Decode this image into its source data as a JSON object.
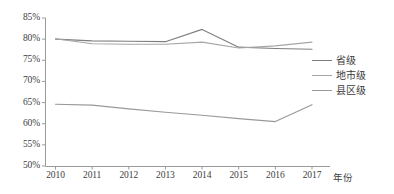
{
  "chart_data": {
    "type": "line",
    "title": "",
    "xlabel": "年份",
    "ylabel": "",
    "categories": [
      "2010",
      "2011",
      "2012",
      "2013",
      "2014",
      "2015",
      "2016",
      "2017"
    ],
    "x": [
      2010,
      2011,
      2012,
      2013,
      2014,
      2015,
      2016,
      2017
    ],
    "ylim": [
      50,
      85
    ],
    "yticks": [
      50,
      55,
      60,
      65,
      70,
      75,
      80,
      85
    ],
    "ytick_labels": [
      "50%",
      "55%",
      "60%",
      "65%",
      "70%",
      "75%",
      "80%",
      "85%"
    ],
    "grid": false,
    "legend_position": "right",
    "series": [
      {
        "name": "省级",
        "color": "#7f7f7f",
        "values": [
          80.0,
          79.6,
          79.5,
          79.4,
          82.3,
          78.1,
          77.8,
          77.6
        ]
      },
      {
        "name": "地市级",
        "color": "#a6a6a6",
        "values": [
          80.1,
          78.9,
          78.8,
          78.8,
          79.3,
          77.9,
          78.4,
          79.3
        ]
      },
      {
        "name": "县区级",
        "color": "#999999",
        "values": [
          64.6,
          64.4,
          63.5,
          62.7,
          62.0,
          61.2,
          60.5,
          64.5
        ]
      }
    ]
  },
  "axis": {
    "x_title": "年份",
    "y_tick_labels": [
      "85%",
      "80%",
      "75%",
      "70%",
      "65%",
      "60%",
      "55%",
      "50%"
    ],
    "x_tick_labels": [
      "2010",
      "2011",
      "2012",
      "2013",
      "2014",
      "2015",
      "2016",
      "2017"
    ]
  },
  "legend": {
    "items": [
      {
        "label": "省级",
        "color": "#7f7f7f"
      },
      {
        "label": "地市级",
        "color": "#a6a6a6"
      },
      {
        "label": "县区级",
        "color": "#999999"
      }
    ]
  },
  "colors": {
    "axis": "#9a9a9a",
    "text": "#3a3a3a",
    "background": "#ffffff"
  }
}
